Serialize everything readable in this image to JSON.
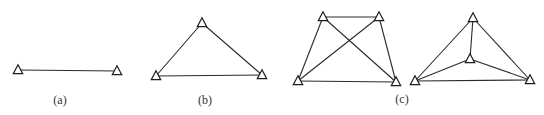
{
  "figure": {
    "colors": {
      "line": "#2a2a2a",
      "marker_stroke": "#1e1e1e",
      "marker_fill": "#ffffff",
      "label": "#333333"
    },
    "panels": [
      {
        "id": "a",
        "label": "(a)",
        "label_pos": [
          60,
          100
        ],
        "stations": [
          [
            18,
            70
          ],
          [
            117,
            71
          ]
        ],
        "edges": [
          [
            0,
            1
          ]
        ]
      },
      {
        "id": "b",
        "label": "(b)",
        "label_pos": [
          205,
          100
        ],
        "stations": [
          [
            202,
            23
          ],
          [
            156,
            76
          ],
          [
            262,
            75
          ]
        ],
        "edges": [
          [
            0,
            1
          ],
          [
            0,
            2
          ],
          [
            1,
            2
          ]
        ]
      },
      {
        "id": "c1",
        "label": "",
        "stations": [
          [
            323,
            17
          ],
          [
            379,
            17
          ],
          [
            298,
            81
          ],
          [
            396,
            82
          ]
        ],
        "edges": [
          [
            0,
            1
          ],
          [
            0,
            2
          ],
          [
            1,
            3
          ],
          [
            2,
            3
          ],
          [
            0,
            3
          ],
          [
            1,
            2
          ]
        ]
      },
      {
        "id": "c2",
        "label": "",
        "stations": [
          [
            473,
            18
          ],
          [
            470,
            59
          ],
          [
            415,
            81
          ],
          [
            530,
            80
          ]
        ],
        "edges": [
          [
            0,
            2
          ],
          [
            0,
            3
          ],
          [
            2,
            3
          ],
          [
            0,
            1
          ],
          [
            1,
            2
          ],
          [
            1,
            3
          ]
        ]
      }
    ],
    "shared_label": {
      "text": "(c)",
      "pos": [
        402,
        99
      ]
    }
  }
}
